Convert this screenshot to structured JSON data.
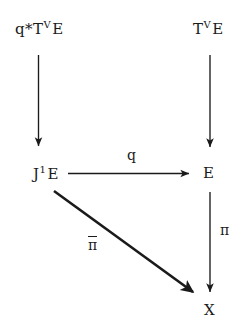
{
  "diagram": {
    "type": "commutative-diagram",
    "background_color": "#ffffff",
    "ink_color": "#1a1a1a",
    "nodes": [
      {
        "id": "qtve",
        "text": "q*T E",
        "base_before": "q*T",
        "superscript": "V",
        "base_after": "E",
        "position": "top-left"
      },
      {
        "id": "tve",
        "text": "T E",
        "base_before": "T",
        "superscript": "V",
        "base_after": "E",
        "position": "top-right"
      },
      {
        "id": "j1e",
        "text": "J E",
        "base_before": "J",
        "superscript": "1",
        "base_after": "E",
        "position": "middle-left"
      },
      {
        "id": "e",
        "text": "E",
        "base_before": "E",
        "superscript": "",
        "base_after": "",
        "position": "middle-right"
      },
      {
        "id": "x",
        "text": "X",
        "base_before": "X",
        "superscript": "",
        "base_after": "",
        "position": "bottom-right"
      }
    ],
    "arrows": [
      {
        "id": "left-vertical",
        "from": "qtve",
        "to": "j1e",
        "direction": "down",
        "label": ""
      },
      {
        "id": "right-vertical-top",
        "from": "tve",
        "to": "e",
        "direction": "down",
        "label": ""
      },
      {
        "id": "horizontal",
        "from": "j1e",
        "to": "e",
        "direction": "right",
        "label": "q"
      },
      {
        "id": "right-vertical-bottom",
        "from": "e",
        "to": "x",
        "direction": "down",
        "label": "π"
      },
      {
        "id": "diagonal",
        "from": "j1e",
        "to": "x",
        "direction": "down-right",
        "label": "π",
        "label_overline": true
      }
    ],
    "labels": {
      "q": "q",
      "pi": "π",
      "pi_bar": "π"
    }
  }
}
